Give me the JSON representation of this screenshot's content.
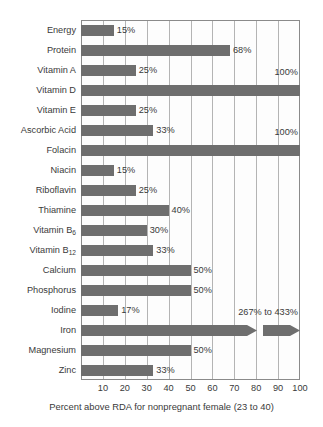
{
  "chart_data": {
    "type": "bar",
    "orientation": "horizontal",
    "title": "",
    "xlabel": "Percent above RDA for nonpregnant female (23 to 40)",
    "ylabel": "",
    "xlim": [
      0,
      100
    ],
    "xticks": [
      10,
      20,
      30,
      40,
      50,
      60,
      70,
      80,
      90,
      100
    ],
    "xtick_labels": [
      "10",
      "20",
      "30",
      "40",
      "50",
      "60",
      "70",
      "80",
      "90",
      "100"
    ],
    "grid": true,
    "legend": "none",
    "bar_color": "#6e6e6e",
    "categories": [
      "Energy",
      "Protein",
      "Vitamin A",
      "Vitamin D",
      "Vitamin E",
      "Ascorbic Acid",
      "Folacin",
      "Niacin",
      "Riboflavin",
      "Thiamine",
      "Vitamin B6",
      "Vitamin B12",
      "Calcium",
      "Phosphorus",
      "Iodine",
      "Iron",
      "Magnesium",
      "Zinc"
    ],
    "values": [
      15,
      68,
      25,
      100,
      25,
      33,
      100,
      15,
      25,
      40,
      30,
      33,
      50,
      50,
      17,
      433,
      50,
      33
    ],
    "data_labels": [
      "15%",
      "68%",
      "25%",
      "100%",
      "25%",
      "33%",
      "100%",
      "15%",
      "25%",
      "40%",
      "30%",
      "33%",
      "50%",
      "50%",
      "17%",
      "267% to 433%",
      "50%",
      "33%"
    ],
    "notes": [
      "Iron bar is broken/truncated with a double-chevron arrow; its range is 267% to 433%, beyond the 100% axis maximum.",
      "Vitamin D and Folacin bars reach the 100% axis maximum; their labels are placed above the bar at the right edge.",
      "Iron label '267% to 433%' is placed above the bar near the right edge."
    ]
  },
  "rows": [
    {
      "label": "Energy",
      "label_html": "Energy",
      "value": 15,
      "data_label": "15%",
      "label_pos": "right"
    },
    {
      "label": "Protein",
      "label_html": "Protein",
      "value": 68,
      "data_label": "68%",
      "label_pos": "right"
    },
    {
      "label": "Vitamin A",
      "label_html": "Vitamin A",
      "value": 25,
      "data_label": "25%",
      "label_pos": "right"
    },
    {
      "label": "Vitamin D",
      "label_html": "Vitamin D",
      "value": 100,
      "data_label": "100%",
      "label_pos": "above"
    },
    {
      "label": "Vitamin E",
      "label_html": "Vitamin E",
      "value": 25,
      "data_label": "25%",
      "label_pos": "right"
    },
    {
      "label": "Ascorbic Acid",
      "label_html": "Ascorbic Acid",
      "value": 33,
      "data_label": "33%",
      "label_pos": "right"
    },
    {
      "label": "Folacin",
      "label_html": "Folacin",
      "value": 100,
      "data_label": "100%",
      "label_pos": "above"
    },
    {
      "label": "Niacin",
      "label_html": "Niacin",
      "value": 15,
      "data_label": "15%",
      "label_pos": "right"
    },
    {
      "label": "Riboflavin",
      "label_html": "Riboflavin",
      "value": 25,
      "data_label": "25%",
      "label_pos": "right"
    },
    {
      "label": "Thiamine",
      "label_html": "Thiamine",
      "value": 40,
      "data_label": "40%",
      "label_pos": "right"
    },
    {
      "label": "Vitamin B6",
      "label_html": "Vitamin B<sub>6</sub>",
      "value": 30,
      "data_label": "30%",
      "label_pos": "right"
    },
    {
      "label": "Vitamin B12",
      "label_html": "Vitamin B<sub>12</sub>",
      "value": 33,
      "data_label": "33%",
      "label_pos": "right"
    },
    {
      "label": "Calcium",
      "label_html": "Calcium",
      "value": 50,
      "data_label": "50%",
      "label_pos": "right"
    },
    {
      "label": "Phosphorus",
      "label_html": "Phosphorus",
      "value": 50,
      "data_label": "50%",
      "label_pos": "right"
    },
    {
      "label": "Iodine",
      "label_html": "Iodine",
      "value": 17,
      "data_label": "17%",
      "label_pos": "right"
    },
    {
      "label": "Iron",
      "label_html": "Iron",
      "value": 433,
      "data_label": "267% to 433%",
      "label_pos": "above",
      "broken": true
    },
    {
      "label": "Magnesium",
      "label_html": "Magnesium",
      "value": 50,
      "data_label": "50%",
      "label_pos": "right"
    },
    {
      "label": "Zinc",
      "label_html": "Zinc",
      "value": 33,
      "data_label": "33%",
      "label_pos": "right"
    }
  ]
}
